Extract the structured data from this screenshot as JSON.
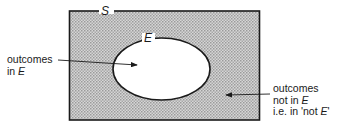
{
  "diagram": {
    "type": "venn",
    "sample_space_label": "S",
    "event_label": "E",
    "left_annotation": {
      "line1": "outcomes",
      "line2_prefix": "in ",
      "line2_var": "E"
    },
    "right_annotation": {
      "line1": "outcomes",
      "line2_prefix": "not in ",
      "line2_var": "E",
      "line3_prefix": "i.e. in 'not ",
      "line3_var": "E",
      "line3_suffix": "'"
    },
    "colors": {
      "shading": "#c8c8c8",
      "outline": "#1a1a1a",
      "event_fill": "#ffffff"
    }
  }
}
